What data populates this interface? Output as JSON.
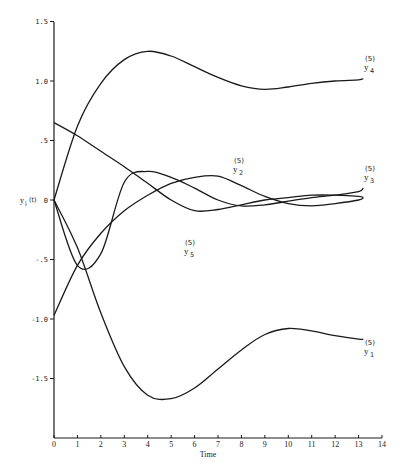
{
  "chart_data": {
    "type": "line",
    "title": "",
    "xlabel": "Time",
    "ylabel": "y_i(t)",
    "xlim": [
      0,
      14
    ],
    "ylim": [
      -2.0,
      1.5
    ],
    "grid": false,
    "legend": "inline labels at curve ends",
    "x_ticks": [
      "0",
      "1",
      "2",
      "3",
      "4",
      "5",
      "6",
      "7",
      "8",
      "9",
      "10",
      "11",
      "12",
      "13",
      "14"
    ],
    "y_ticks": [
      {
        "value": 1.5,
        "label": "1.5"
      },
      {
        "value": 1.0,
        "label": "1.0"
      },
      {
        "value": 0.5,
        "label": ".5"
      },
      {
        "value": 0,
        "label": "0"
      },
      {
        "value": -0.5,
        "label": "-.5"
      },
      {
        "value": -1.0,
        "label": "-1.0"
      },
      {
        "value": -1.5,
        "label": "-1.5"
      }
    ],
    "x": [
      0,
      1,
      2,
      3,
      4,
      5,
      6,
      7,
      8,
      9,
      10,
      11,
      12,
      13,
      13.2
    ],
    "series": [
      {
        "name": "y4(5)",
        "label_sup": "(5)",
        "label_main": "y",
        "label_sub": "4",
        "values": [
          0.0,
          0.62,
          0.98,
          1.18,
          1.25,
          1.21,
          1.12,
          1.03,
          0.96,
          0.93,
          0.95,
          0.98,
          1.0,
          1.01,
          1.02
        ]
      },
      {
        "name": "y1(5)",
        "label_sup": "(5)",
        "label_main": "y",
        "label_sub": "1",
        "values": [
          0.0,
          -0.4,
          -0.95,
          -1.4,
          -1.64,
          -1.67,
          -1.58,
          -1.42,
          -1.26,
          -1.13,
          -1.08,
          -1.1,
          -1.14,
          -1.17,
          -1.17
        ]
      },
      {
        "name": "y2(5)",
        "label_sup": "(5)",
        "label_main": "y",
        "label_sub": "2",
        "values": [
          -0.97,
          -0.55,
          -0.28,
          -0.09,
          0.04,
          0.14,
          0.19,
          0.2,
          0.12,
          0.03,
          -0.03,
          -0.05,
          -0.03,
          0.0,
          0.02
        ]
      },
      {
        "name": "y3(5)",
        "label_sup": "(5)",
        "label_main": "y",
        "label_sub": "3",
        "values": [
          0.0,
          -0.55,
          -0.45,
          0.15,
          0.24,
          0.19,
          0.1,
          0.0,
          -0.05,
          -0.04,
          -0.01,
          0.02,
          0.04,
          0.07,
          0.1
        ]
      },
      {
        "name": "y5(5)",
        "label_sup": "(5)",
        "label_main": "y",
        "label_sub": "5",
        "values": [
          0.65,
          0.54,
          0.41,
          0.28,
          0.14,
          0.0,
          -0.09,
          -0.08,
          -0.04,
          0.0,
          0.02,
          0.04,
          0.04,
          0.03,
          0.02
        ]
      }
    ]
  },
  "labels": {
    "y_axis_title": "y",
    "y_axis_title_sub": "i",
    "y_axis_title_arg": "(t)",
    "x_axis_title": "Time"
  },
  "colors": {
    "line": "#1a1a1a",
    "background": "#ffffff"
  }
}
